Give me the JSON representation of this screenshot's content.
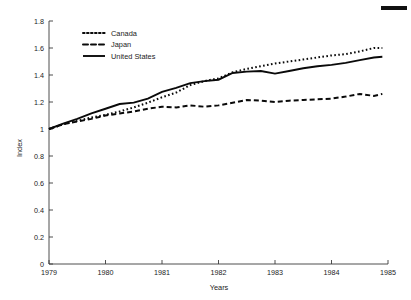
{
  "chart_data": {
    "type": "line",
    "title": "",
    "subtitle": "",
    "xlabel": "Years",
    "ylabel": "Index",
    "xlim": [
      1979,
      1985
    ],
    "ylim": [
      0,
      1.8
    ],
    "grid": false,
    "legend_position": "top-left",
    "xticks": [
      "1979",
      "1980",
      "1981",
      "1982",
      "1983",
      "1984",
      "1985"
    ],
    "xtick_values": [
      1979,
      1980,
      1981,
      1982,
      1983,
      1984,
      1985
    ],
    "yticks": [
      "0",
      "0.2",
      "0.4",
      "0.6",
      "0.8",
      "1",
      "1.2",
      "1.4",
      "1.6",
      "1.8"
    ],
    "ytick_values": [
      0,
      0.2,
      0.4,
      0.6,
      0.8,
      1.0,
      1.2,
      1.4,
      1.6,
      1.8
    ],
    "x": [
      1979.0,
      1979.25,
      1979.5,
      1979.75,
      1980.0,
      1980.25,
      1980.5,
      1980.75,
      1981.0,
      1981.25,
      1981.5,
      1981.75,
      1982.0,
      1982.25,
      1982.5,
      1982.75,
      1983.0,
      1983.25,
      1983.5,
      1983.75,
      1984.0,
      1984.25,
      1984.5,
      1984.75,
      1984.9
    ],
    "series": [
      {
        "name": "Canada",
        "style": "dotted",
        "color": "#0a0a0a",
        "values": [
          1.0,
          1.035,
          1.06,
          1.085,
          1.105,
          1.13,
          1.16,
          1.195,
          1.235,
          1.27,
          1.325,
          1.355,
          1.375,
          1.42,
          1.445,
          1.465,
          1.485,
          1.5,
          1.515,
          1.53,
          1.545,
          1.555,
          1.575,
          1.6,
          1.6
        ]
      },
      {
        "name": "Japan",
        "style": "dashed",
        "color": "#0a0a0a",
        "values": [
          1.0,
          1.035,
          1.055,
          1.075,
          1.1,
          1.115,
          1.13,
          1.15,
          1.165,
          1.16,
          1.175,
          1.165,
          1.175,
          1.195,
          1.215,
          1.21,
          1.2,
          1.21,
          1.215,
          1.22,
          1.225,
          1.24,
          1.26,
          1.245,
          1.26
        ]
      },
      {
        "name": "United States",
        "style": "solid",
        "color": "#0a0a0a",
        "values": [
          1.0,
          1.04,
          1.075,
          1.115,
          1.15,
          1.185,
          1.195,
          1.225,
          1.275,
          1.305,
          1.34,
          1.355,
          1.365,
          1.415,
          1.425,
          1.43,
          1.41,
          1.43,
          1.45,
          1.465,
          1.475,
          1.49,
          1.51,
          1.53,
          1.535
        ]
      }
    ]
  },
  "legend": {
    "items": [
      {
        "label": "Canada"
      },
      {
        "label": "Japan"
      },
      {
        "label": "United States"
      }
    ]
  },
  "axes": {
    "y_title": "Index",
    "x_title": "Years"
  }
}
